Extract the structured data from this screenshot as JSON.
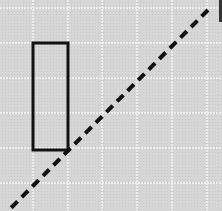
{
  "diagram": {
    "width": 222,
    "height": 211,
    "background_color": "#d6d6d6",
    "grid": {
      "color": "#f4f4f4",
      "vertical_lines_x": [
        33,
        68,
        102,
        137,
        172,
        207
      ],
      "horizontal_lines_y": [
        8,
        43,
        78,
        113,
        148,
        183
      ]
    },
    "rectangle": {
      "x": 33,
      "y": 43,
      "width": 35,
      "height": 107,
      "stroke_color": "#111111",
      "stroke_width": 3
    },
    "dashed_line": {
      "x1": 208,
      "y1": 10,
      "x2": 8,
      "y2": 211,
      "stroke_color": "#111111",
      "stroke_width": 4,
      "dash": "9 6"
    },
    "edge_bar": {
      "x": 219,
      "y": 0,
      "width": 3,
      "height": 22,
      "color": "#333333"
    }
  }
}
